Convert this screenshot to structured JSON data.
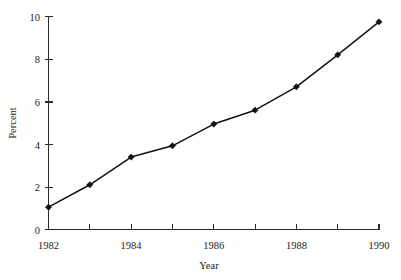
{
  "chart_data": {
    "type": "line",
    "title": "",
    "xlabel": "Year",
    "ylabel": "Percent",
    "x": [
      1982,
      1983,
      1984,
      1985,
      1986,
      1987,
      1988,
      1989,
      1990
    ],
    "values": [
      1.05,
      2.1,
      3.4,
      3.93,
      4.95,
      5.6,
      6.7,
      8.2,
      9.75
    ],
    "series": [
      {
        "name": "Percent",
        "values": [
          1.05,
          2.1,
          3.4,
          3.93,
          4.95,
          5.6,
          6.7,
          8.2,
          9.75
        ]
      }
    ],
    "xlim": [
      1982,
      1990
    ],
    "ylim": [
      0,
      10
    ],
    "xticks": [
      1982,
      1983,
      1984,
      1985,
      1986,
      1987,
      1988,
      1989,
      1990
    ],
    "xticklabels": [
      "1982",
      "",
      "1984",
      "",
      "1986",
      "",
      "1988",
      "",
      "1990"
    ],
    "yticks": [
      0,
      2,
      4,
      6,
      8,
      10
    ],
    "yticklabels": [
      "0",
      "2",
      "4",
      "6",
      "8",
      "10"
    ],
    "grid": false,
    "legend": false,
    "legend_position": "none",
    "marker": "diamond",
    "line_color": "#111111",
    "marker_color": "#111111",
    "axis_color": "#2b2b2b",
    "background_color": "#ffffff"
  },
  "axes": {
    "y_label": "Percent",
    "x_label": "Year",
    "y_tick_labels": [
      "10",
      "8",
      "6",
      "4",
      "2",
      "0"
    ],
    "x_tick_labels": [
      "1982",
      "1984",
      "1986",
      "1988",
      "1990"
    ]
  }
}
